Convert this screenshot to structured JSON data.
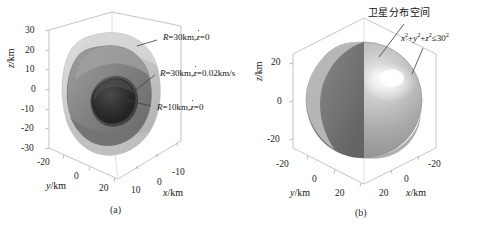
{
  "figure": {
    "panels": [
      {
        "id": "a",
        "caption": "(a)",
        "axes": {
          "z": {
            "label_var": "z",
            "label_unit": "/km",
            "ticks": [
              "30",
              "20",
              "10",
              "0",
              "-10",
              "-20",
              "-30"
            ]
          },
          "y": {
            "label_var": "y",
            "label_unit": "/km",
            "ticks": [
              "-20",
              "0",
              "20"
            ]
          },
          "x": {
            "label_var": "x",
            "label_unit": "/km",
            "ticks": [
              "-10",
              "0",
              "10"
            ]
          }
        },
        "annotations": [
          {
            "name": "outer-surface-label",
            "R": "R",
            "eq1": "=30km,",
            "zdot": "z",
            "eq2": "=0"
          },
          {
            "name": "middle-surface-label",
            "R": "R",
            "eq1": "=30km,",
            "zdot": "z",
            "eq2": "=0.02km/s"
          },
          {
            "name": "inner-surface-label",
            "R": "R",
            "eq1": "=10km,",
            "zdot": "z",
            "eq2": "=0"
          }
        ],
        "surfaces": [
          {
            "name": "outer-isosurface",
            "fill": "#c9c9c9"
          },
          {
            "name": "middle-isosurface",
            "fill": "#8d8d8d"
          },
          {
            "name": "inner-isosurface",
            "fill": "#2b2b2b"
          }
        ]
      },
      {
        "id": "b",
        "caption": "(b)",
        "axes": {
          "z": {
            "label_var": "z",
            "label_unit": "/km",
            "ticks": [
              "20",
              "0",
              "-20"
            ]
          },
          "y": {
            "label_var": "y",
            "label_unit": "/km",
            "ticks": [
              "-20",
              "0",
              "20"
            ]
          },
          "x": {
            "label_var": "x",
            "label_unit": "/km",
            "ticks": [
              "20",
              "0",
              "-20"
            ]
          }
        },
        "annotations": [
          {
            "name": "satellite-space-label",
            "text": "卫星分布空间"
          },
          {
            "name": "sphere-equation-label",
            "x": "x",
            "p1": "2",
            "plus1": "+",
            "y": "y",
            "p2": "2",
            "plus2": "+",
            "z": "z",
            "p3": "2",
            "rel": "≤30",
            "p4": "2"
          }
        ],
        "surfaces": [
          {
            "name": "sphere-surface",
            "fill": "#a8a8a8"
          },
          {
            "name": "sphere-cut-interior",
            "fill": "#6e6e6e"
          }
        ]
      }
    ],
    "colors": {
      "axis_line": "#b4b4b4",
      "leader_line": "#4a4a4a",
      "text": "#111111",
      "background": "#ffffff"
    }
  }
}
